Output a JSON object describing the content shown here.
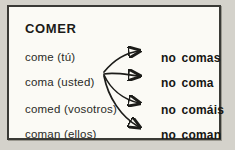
{
  "card": {
    "title": "COMER",
    "rows": [
      {
        "affirmative": "come (tú)",
        "negative": "no comas"
      },
      {
        "affirmative": "coma (usted)",
        "negative": "no coma"
      },
      {
        "affirmative": "comed (vosotros)",
        "negative": "no comáis"
      },
      {
        "affirmative": "coman (ellos)",
        "negative": "no coman"
      }
    ]
  },
  "colors": {
    "page_background": "#d4d2cb",
    "panel_background": "#fbfaf5",
    "border": "#3a3a36",
    "text": "#1b1b18",
    "arrow": "#1c1c19"
  }
}
